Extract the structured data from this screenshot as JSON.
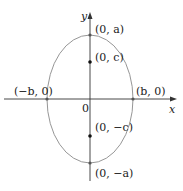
{
  "diagram": {
    "type": "ellipse-vertical-major-axis",
    "colors": {
      "axis": "#333333",
      "curve": "#8a8a8a",
      "point": "#111111",
      "text": "#222222"
    },
    "axes": {
      "x_label": "x",
      "y_label": "y",
      "origin_label": "0"
    },
    "ellipse": {
      "center": [
        90,
        99
      ],
      "rx": 43,
      "ry": 64
    },
    "points": {
      "top_vertex": {
        "label": "(0, a)",
        "pos": [
          90,
          35
        ]
      },
      "top_focus": {
        "label": "(0, c)",
        "pos": [
          90,
          62
        ]
      },
      "right_vertex": {
        "label": "(b, 0)",
        "pos": [
          133,
          99
        ]
      },
      "left_vertex": {
        "label": "(−b, 0)",
        "pos": [
          47,
          99
        ]
      },
      "bottom_focus": {
        "label": "(0, −c)",
        "pos": [
          90,
          136
        ]
      },
      "bottom_vertex": {
        "label": "(0, −a)",
        "pos": [
          90,
          163
        ]
      }
    }
  }
}
